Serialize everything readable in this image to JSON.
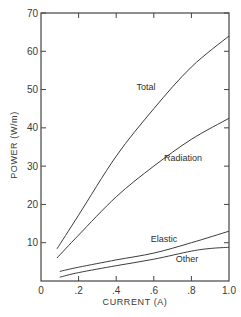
{
  "chart_data": {
    "type": "line",
    "title": "",
    "xlabel": "CURRENT (A)",
    "ylabel": "POWER (W/m)",
    "xlim": [
      0,
      1.0
    ],
    "ylim": [
      0,
      70
    ],
    "x_ticks": [
      "0",
      ".2",
      ".4",
      ".6",
      ".8",
      "1.0"
    ],
    "y_ticks": [
      "10",
      "20",
      "30",
      "40",
      "50",
      "60",
      "70"
    ],
    "grid": false,
    "legend": "inline labels",
    "series": [
      {
        "name": "Total",
        "x": [
          0.085,
          0.2,
          0.4,
          0.6,
          0.8,
          1.0
        ],
        "values": [
          8.4,
          17.2,
          32.6,
          45.0,
          55.9,
          64.0
        ]
      },
      {
        "name": "Radiation",
        "x": [
          0.085,
          0.2,
          0.4,
          0.6,
          0.8,
          1.0
        ],
        "values": [
          6.0,
          12.0,
          22.0,
          30.0,
          37.0,
          42.5
        ]
      },
      {
        "name": "Elastic",
        "x": [
          0.1,
          0.2,
          0.4,
          0.6,
          0.8,
          1.0
        ],
        "values": [
          2.5,
          3.6,
          5.5,
          7.3,
          10.0,
          13.0
        ]
      },
      {
        "name": "Other",
        "x": [
          0.1,
          0.2,
          0.4,
          0.6,
          0.8,
          0.9,
          1.0
        ],
        "values": [
          1.0,
          2.2,
          4.0,
          5.7,
          7.8,
          8.5,
          8.8
        ]
      }
    ],
    "annotations": [
      "Total",
      "Radiation",
      "Elastic",
      "Other"
    ]
  }
}
